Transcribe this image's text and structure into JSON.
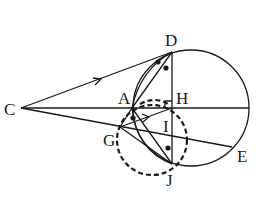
{
  "diagram": {
    "type": "geometry",
    "points": {
      "C": "C",
      "D": "D",
      "A": "A",
      "H": "H",
      "I": "I",
      "G": "G",
      "E": "E",
      "J": "J"
    },
    "segments": [
      {
        "from": "C",
        "to": "D",
        "arrow": true
      },
      {
        "from": "C",
        "to": "A",
        "extends_to": "circle-right"
      },
      {
        "from": "C",
        "to": "E",
        "through": "G"
      },
      {
        "from": "D",
        "to": "J"
      },
      {
        "from": "D",
        "to": "A"
      },
      {
        "from": "A",
        "to": "J"
      },
      {
        "from": "G",
        "to": "J"
      },
      {
        "from": "G",
        "to": "H",
        "arrow": true
      },
      {
        "from": "G",
        "to": "A"
      }
    ],
    "circles": [
      {
        "name": "large-circle",
        "style": "solid",
        "through": [
          "D",
          "A",
          "E",
          "J"
        ]
      },
      {
        "name": "dashed-circle",
        "style": "dashed",
        "through": [
          "A",
          "G",
          "J"
        ]
      }
    ],
    "markers": {
      "right_angle_at": "H",
      "equal_angle_dots": 4
    }
  }
}
